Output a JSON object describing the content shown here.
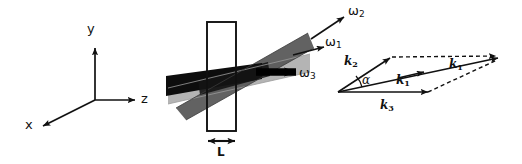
{
  "figure": {
    "background_color": "#ffffff",
    "stroke_color": "#111111"
  },
  "axes": {
    "name": "coordinate-axes",
    "origin": {
      "x": 95,
      "y": 100
    },
    "labels": {
      "y": "y",
      "z": "z",
      "x": "x"
    },
    "y_tip": {
      "x": 95,
      "y": 45
    },
    "z_tip": {
      "x": 138,
      "y": 100
    },
    "x_tip": {
      "x": 40,
      "y": 128
    }
  },
  "crystal": {
    "name": "nonlinear-crystal-slab",
    "rect": {
      "x": 207,
      "y": 22,
      "width": 29,
      "height": 109
    },
    "thickness_label": "L",
    "dimension_arrow": {
      "x1": 207,
      "x2": 236,
      "y": 141
    }
  },
  "beams": {
    "omega2": {
      "label": "ω2",
      "label_text": "ω",
      "subscript": "2",
      "color": "#4a4a4a",
      "label_pos": {
        "x": 350,
        "y": 8
      }
    },
    "omega1": {
      "label": "ω1",
      "label_text": "ω",
      "subscript": "1",
      "color": "#a8a8a8",
      "label_pos": {
        "x": 327,
        "y": 39
      }
    },
    "omega3": {
      "label": "ω3",
      "label_text": "ω",
      "subscript": "3",
      "color": "#000000",
      "label_pos": {
        "x": 299,
        "y": 76
      }
    }
  },
  "vector_diagram": {
    "name": "phase-matching-vector-diagram",
    "origin": {
      "x": 338,
      "y": 92
    },
    "vectors": [
      {
        "name": "k2",
        "symbol": "k",
        "subscript": "2",
        "label_pos": {
          "x": 346,
          "y": 60
        },
        "style": "solid"
      },
      {
        "name": "k1-lower",
        "symbol": "k",
        "subscript": "1",
        "label_pos": {
          "x": 398,
          "y": 78
        },
        "style": "solid"
      },
      {
        "name": "k1-upper",
        "symbol": "k",
        "subscript": "1",
        "label_pos": {
          "x": 450,
          "y": 62
        },
        "style": "solid"
      },
      {
        "name": "k3",
        "symbol": "k",
        "subscript": "3",
        "label_pos": {
          "x": 382,
          "y": 103
        },
        "style": "solid"
      }
    ],
    "angle": {
      "symbol": "α",
      "label_pos": {
        "x": 357,
        "y": 78
      }
    },
    "dashed_edges": 2
  }
}
